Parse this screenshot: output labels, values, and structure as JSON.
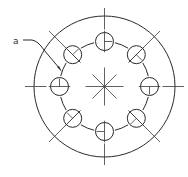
{
  "diagram": {
    "type": "bolt-hole-circle",
    "label": "a",
    "center": [
      104.5,
      86.5
    ],
    "outer_radius": 70.5,
    "bolt_circle_radius": 45,
    "hole_radius": 9,
    "hole_count": 8,
    "hole_angles_deg": [
      270,
      315,
      0,
      45,
      90,
      135,
      180,
      225
    ],
    "stroke_color": "#2a2a2a",
    "background": "#ffffff"
  }
}
